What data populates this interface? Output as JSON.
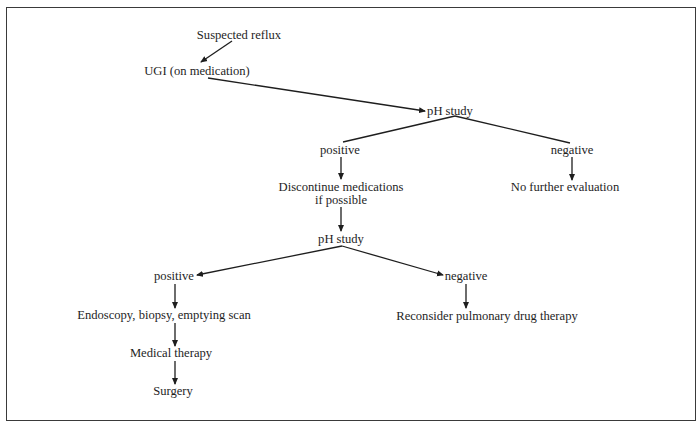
{
  "diagram": {
    "type": "flowchart",
    "nodes": {
      "suspected_reflux": "Suspected reflux",
      "ugi": "UGI (on medication)",
      "ph_study_1": "pH study",
      "positive_1": "positive",
      "negative_1": "negative",
      "discontinue_line1": "Discontinue medications",
      "discontinue_line2": "if possible",
      "no_further": "No further evaluation",
      "ph_study_2": "pH study",
      "positive_2": "positive",
      "negative_2": "negative",
      "endoscopy": "Endoscopy, biopsy, emptying scan",
      "reconsider": "Reconsider pulmonary drug therapy",
      "medical_therapy": "Medical therapy",
      "surgery": "Surgery"
    },
    "edges": [
      {
        "from": "Suspected reflux",
        "to": "UGI (on medication)"
      },
      {
        "from": "UGI (on medication)",
        "to": "pH study"
      },
      {
        "from": "pH study",
        "to": "positive"
      },
      {
        "from": "pH study",
        "to": "negative"
      },
      {
        "from": "positive",
        "to": "Discontinue medications if possible"
      },
      {
        "from": "negative",
        "to": "No further evaluation"
      },
      {
        "from": "Discontinue medications if possible",
        "to": "pH study"
      },
      {
        "from": "pH study",
        "to": "positive"
      },
      {
        "from": "pH study",
        "to": "negative"
      },
      {
        "from": "positive",
        "to": "Endoscopy, biopsy, emptying scan"
      },
      {
        "from": "negative",
        "to": "Reconsider pulmonary drug therapy"
      },
      {
        "from": "Endoscopy, biopsy, emptying scan",
        "to": "Medical therapy"
      },
      {
        "from": "Medical therapy",
        "to": "Surgery"
      }
    ],
    "colors": {
      "line": "#1e1e1e",
      "text": "#1e1e1e",
      "border": "#3a3a3a",
      "background": "#ffffff"
    }
  }
}
